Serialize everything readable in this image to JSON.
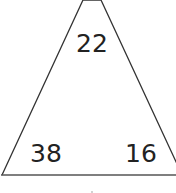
{
  "diagram": {
    "shape": "triangle",
    "top_value": "22",
    "bottom_left_value": "38",
    "bottom_right_value": "16",
    "stroke_color": "#333333",
    "text_color": "#222222",
    "background": "#ffffff"
  }
}
